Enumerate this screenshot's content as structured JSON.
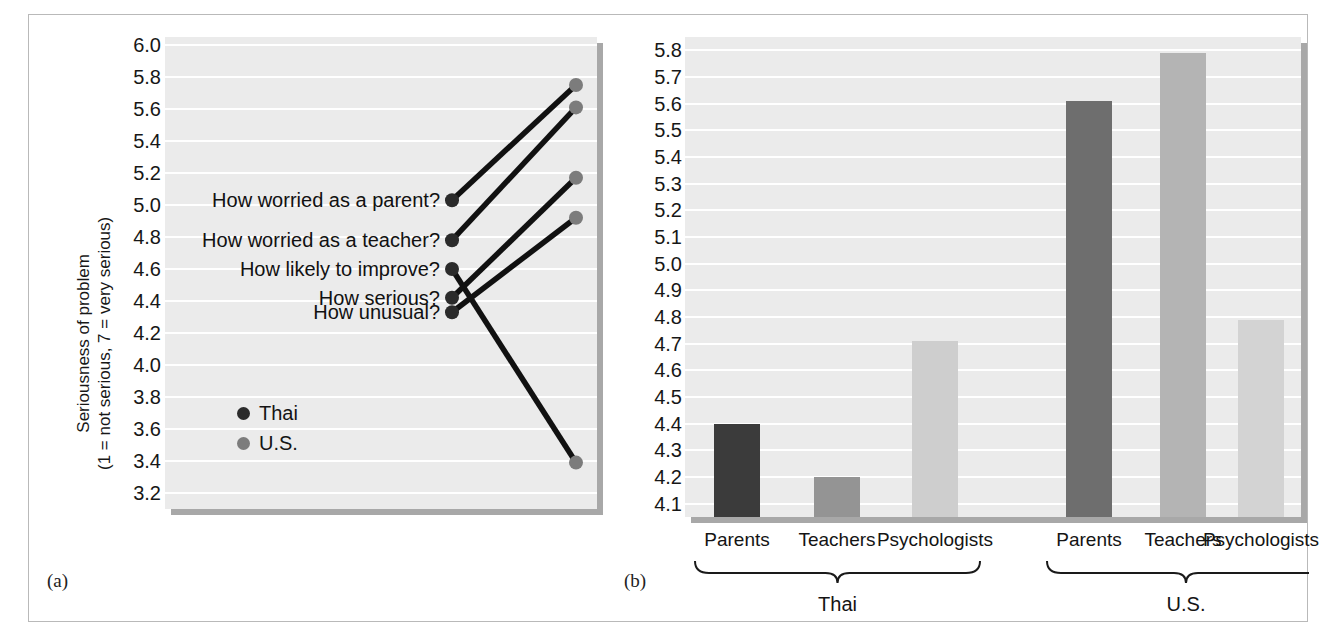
{
  "figure": {
    "panel_a_label": "(a)",
    "panel_b_label": "(b)"
  },
  "chart_data": [
    {
      "type": "line",
      "id": "slopegraph",
      "title": "",
      "xlabel": "",
      "ylabel": "Seriousness of problem (1 = not serious, 7 = very serious)",
      "ylabel_line1": "Seriousness of problem",
      "ylabel_line2": "(1 = not serious, 7 = very serious)",
      "ylim": [
        3.1,
        6.05
      ],
      "ytick_labels": [
        "6.0",
        "5.8",
        "5.6",
        "5.4",
        "5.2",
        "5.0",
        "4.8",
        "4.6",
        "4.4",
        "4.2",
        "4.0",
        "3.8",
        "3.6",
        "3.4",
        "3.2"
      ],
      "ytick_values": [
        6.0,
        5.8,
        5.6,
        5.4,
        5.2,
        5.0,
        4.8,
        4.6,
        4.4,
        4.2,
        4.0,
        3.8,
        3.6,
        3.4,
        3.2
      ],
      "grid": true,
      "legend_position": "inside-left",
      "legend": [
        {
          "name": "Thai",
          "color": "#2b2b2b"
        },
        {
          "name": "U.S.",
          "color": "#7c7c7c"
        }
      ],
      "series": [
        {
          "name": "Thai",
          "color": "#2b2b2b",
          "values": [
            5.03,
            4.78,
            4.6,
            4.42,
            4.33
          ]
        },
        {
          "name": "U.S.",
          "color": "#7c7c7c",
          "values": [
            5.75,
            5.61,
            3.39,
            5.17,
            4.92
          ]
        }
      ],
      "categories": [
        "How worried as a parent?",
        "How worried as a teacher?",
        "How likely to improve?",
        "How serious?",
        "How unusual?"
      ],
      "items": [
        {
          "label": "How worried as a parent?",
          "thai": 5.03,
          "us": 5.75
        },
        {
          "label": "How worried as a teacher?",
          "thai": 4.78,
          "us": 5.61
        },
        {
          "label": "How likely to improve?",
          "thai": 4.6,
          "us": 3.39
        },
        {
          "label": "How serious?",
          "thai": 4.42,
          "us": 5.17
        },
        {
          "label": "How unusual?",
          "thai": 4.33,
          "us": 4.92
        }
      ]
    },
    {
      "type": "bar",
      "id": "bargraph",
      "title": "",
      "xlabel": "",
      "ylabel": "",
      "ylim": [
        4.05,
        5.85
      ],
      "ytick_labels": [
        "5.8",
        "5.7",
        "5.6",
        "5.5",
        "5.4",
        "5.3",
        "5.2",
        "5.1",
        "5.0",
        "4.9",
        "4.8",
        "4.7",
        "4.6",
        "4.5",
        "4.4",
        "4.3",
        "4.2",
        "4.1"
      ],
      "ytick_values": [
        5.8,
        5.7,
        5.6,
        5.5,
        5.4,
        5.3,
        5.2,
        5.1,
        5.0,
        4.9,
        4.8,
        4.7,
        4.6,
        4.5,
        4.4,
        4.3,
        4.2,
        4.1
      ],
      "grid": true,
      "categories": [
        "Parents",
        "Teachers",
        "Psychologists",
        "Parents",
        "Teachers",
        "Psychologists"
      ],
      "values": [
        4.4,
        4.2,
        4.71,
        5.61,
        5.79,
        4.79
      ],
      "bar_colors": [
        "#3b3b3b",
        "#949494",
        "#cecece",
        "#6e6e6e",
        "#b4b4b4",
        "#d3d3d3"
      ],
      "groups": [
        {
          "name": "Thai",
          "categories": [
            "Parents",
            "Teachers",
            "Psychologists"
          ],
          "values": [
            4.4,
            4.2,
            4.71
          ]
        },
        {
          "name": "U.S.",
          "categories": [
            "Parents",
            "Teachers",
            "Psychologists"
          ],
          "values": [
            5.61,
            5.79,
            4.79
          ]
        }
      ],
      "group_labels": [
        "Thai",
        "U.S."
      ]
    }
  ]
}
